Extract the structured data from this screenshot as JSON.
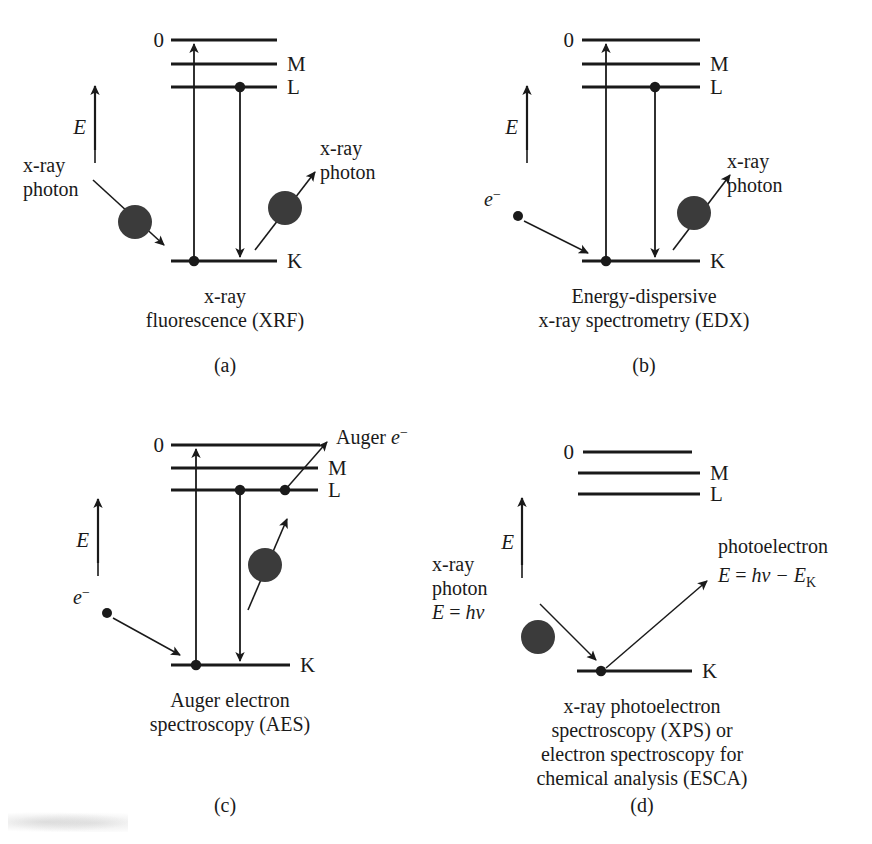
{
  "figure": {
    "background_color": "#ffffff",
    "ink_color": "#1a1a1a",
    "panel_count": 4
  },
  "common": {
    "energy_axis_label": "E",
    "level_zero": "0",
    "level_M": "M",
    "level_L": "L",
    "level_K": "K",
    "xray_photon_line1": "x-ray",
    "xray_photon_line2": "photon",
    "electron_label_base": "e",
    "electron_label_sup": "−"
  },
  "panels": [
    {
      "id": "a",
      "panel_id_label": "(a)",
      "technique_name": "x-ray fluorescence",
      "acronym": "XRF",
      "caption_line1": "x-ray",
      "caption_line2": "fluorescence (XRF)",
      "incoming_particle": "x-ray photon",
      "incoming_label_line1": "x-ray",
      "incoming_label_line2": "photon",
      "outgoing_particle": "x-ray photon",
      "outgoing_label_line1": "x-ray",
      "outgoing_label_line2": "photon",
      "levels": [
        "0",
        "M",
        "L",
        "K"
      ],
      "transitions": [
        {
          "name": "K-to-continuum excitation",
          "from": "K",
          "to": "0",
          "direction": "up"
        },
        {
          "name": "L-to-K relaxation",
          "from": "L",
          "to": "K",
          "direction": "down"
        }
      ]
    },
    {
      "id": "b",
      "panel_id_label": "(b)",
      "technique_name": "Energy-dispersive x-ray spectrometry",
      "acronym": "EDX",
      "caption_line1": "Energy-dispersive",
      "caption_line2": "x-ray spectrometry (EDX)",
      "incoming_particle": "electron",
      "incoming_label_line1": "e",
      "incoming_label_sup": "−",
      "outgoing_particle": "x-ray photon",
      "outgoing_label_line1": "x-ray",
      "outgoing_label_line2": "photon",
      "levels": [
        "0",
        "M",
        "L",
        "K"
      ],
      "transitions": [
        {
          "name": "K-to-continuum excitation",
          "from": "K",
          "to": "0",
          "direction": "up"
        },
        {
          "name": "L-to-K relaxation",
          "from": "L",
          "to": "K",
          "direction": "down"
        }
      ]
    },
    {
      "id": "c",
      "panel_id_label": "(c)",
      "technique_name": "Auger electron spectroscopy",
      "acronym": "AES",
      "caption_line1": "Auger electron",
      "caption_line2": "spectroscopy (AES)",
      "incoming_particle": "electron",
      "incoming_label_line1": "e",
      "incoming_label_sup": "−",
      "outgoing_particle": "Auger electron",
      "outgoing_label_text": "Auger ",
      "outgoing_label_italic": "e",
      "outgoing_label_sup": "−",
      "levels": [
        "0",
        "M",
        "L",
        "K"
      ],
      "transitions": [
        {
          "name": "K-to-continuum excitation",
          "from": "K",
          "to": "0",
          "direction": "up"
        },
        {
          "name": "L-to-K relaxation",
          "from": "L",
          "to": "K",
          "direction": "down"
        },
        {
          "name": "Auger electron ejection",
          "from": "L",
          "to": "continuum",
          "direction": "up-right"
        }
      ]
    },
    {
      "id": "d",
      "panel_id_label": "(d)",
      "technique_name": "x-ray photoelectron spectroscopy / electron spectroscopy for chemical analysis",
      "acronym": "XPS",
      "acronym_alt": "ESCA",
      "caption_line1": "x-ray photoelectron",
      "caption_line2": "spectroscopy (XPS) or",
      "caption_line3": "electron spectroscopy for",
      "caption_line4": "chemical analysis (ESCA)",
      "incoming_particle": "x-ray photon",
      "incoming_label_line1": "x-ray",
      "incoming_label_line2": "photon",
      "incoming_equation": {
        "var": "E",
        "equals": "=",
        "expr_h": "h",
        "expr_nu": "ν",
        "full": "E = hν"
      },
      "outgoing_particle": "photoelectron",
      "outgoing_label_line1": "photoelectron",
      "outgoing_equation": {
        "var": "E",
        "equals": "=",
        "expr_h": "h",
        "expr_nu": "ν",
        "minus": "−",
        "term_E": "E",
        "term_sub": "K",
        "full": "E = hν − E_K"
      },
      "levels": [
        "0",
        "M",
        "L",
        "K"
      ],
      "transitions": [
        {
          "name": "photoelectron ejection from K",
          "from": "K",
          "to": "continuum",
          "direction": "up-right"
        }
      ]
    }
  ]
}
